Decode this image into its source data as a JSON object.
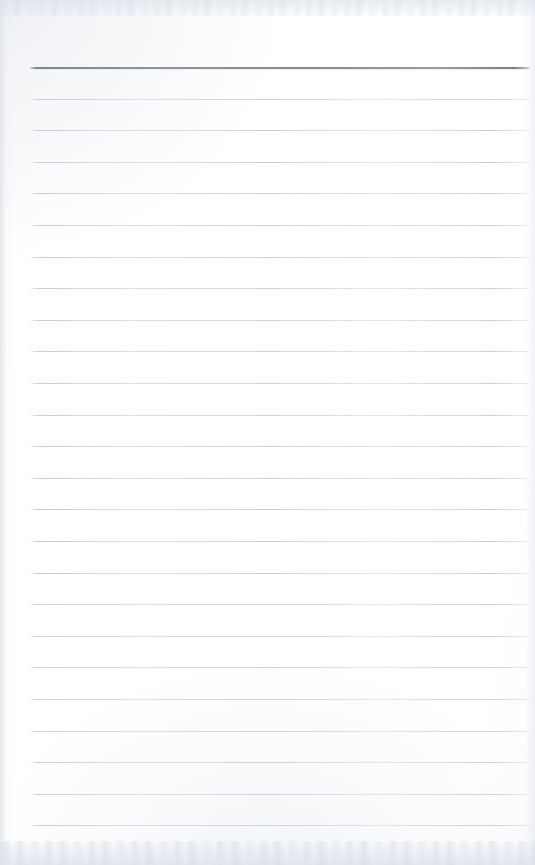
{
  "document": {
    "kind": "scanned-lined-notepad-page",
    "title": "Blank lined notepad page",
    "content_text": "",
    "page_width": 535,
    "page_height": 865,
    "paper_color": "#ffffff",
    "background_tint": "#fdfdfd"
  },
  "ruling": {
    "line_color": "#ccd2da",
    "header_line_color": "#83878e",
    "line_count": 25,
    "first_line_y": 67,
    "line_spacing": 31.6,
    "line_left_x": 30,
    "line_right_x": 529,
    "header_line_index": 0
  },
  "lines": [
    {
      "index": 1,
      "y": 67,
      "style": "header"
    },
    {
      "index": 2,
      "y": 98.6,
      "style": "standard"
    },
    {
      "index": 3,
      "y": 130.2,
      "style": "standard"
    },
    {
      "index": 4,
      "y": 161.8,
      "style": "standard"
    },
    {
      "index": 5,
      "y": 193.4,
      "style": "standard"
    },
    {
      "index": 6,
      "y": 225.0,
      "style": "standard"
    },
    {
      "index": 7,
      "y": 256.6,
      "style": "standard"
    },
    {
      "index": 8,
      "y": 288.2,
      "style": "standard"
    },
    {
      "index": 9,
      "y": 319.8,
      "style": "standard"
    },
    {
      "index": 10,
      "y": 351.4,
      "style": "standard"
    },
    {
      "index": 11,
      "y": 383.0,
      "style": "standard"
    },
    {
      "index": 12,
      "y": 414.6,
      "style": "standard"
    },
    {
      "index": 13,
      "y": 446.2,
      "style": "standard"
    },
    {
      "index": 14,
      "y": 477.8,
      "style": "standard"
    },
    {
      "index": 15,
      "y": 509.4,
      "style": "standard"
    },
    {
      "index": 16,
      "y": 541.0,
      "style": "standard"
    },
    {
      "index": 17,
      "y": 572.6,
      "style": "standard"
    },
    {
      "index": 18,
      "y": 604.2,
      "style": "standard"
    },
    {
      "index": 19,
      "y": 635.8,
      "style": "standard"
    },
    {
      "index": 20,
      "y": 667.4,
      "style": "standard"
    },
    {
      "index": 21,
      "y": 699.0,
      "style": "standard"
    },
    {
      "index": 22,
      "y": 730.6,
      "style": "standard"
    },
    {
      "index": 23,
      "y": 762.2,
      "style": "standard"
    },
    {
      "index": 24,
      "y": 793.8,
      "style": "standard"
    },
    {
      "index": 25,
      "y": 825.4,
      "style": "standard"
    }
  ],
  "scan_artifacts": {
    "top_noise_band": true,
    "bottom_noise_band": true,
    "left_edge_shading": true,
    "right_edge_shading": true
  }
}
